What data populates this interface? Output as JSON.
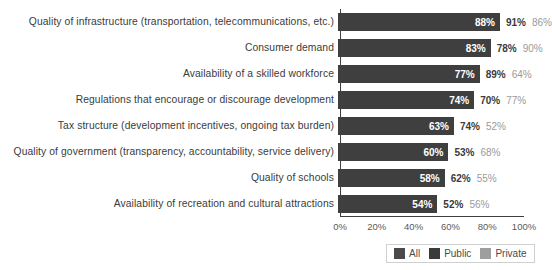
{
  "chart_data": {
    "type": "bar",
    "orientation": "horizontal",
    "title": "",
    "xlabel": "",
    "ylabel": "",
    "xlim": [
      0,
      100
    ],
    "xticks": [
      "0%",
      "20%",
      "40%",
      "60%",
      "80%",
      "100%"
    ],
    "xtick_values": [
      0,
      20,
      40,
      60,
      80,
      100
    ],
    "grid": false,
    "legend_position": "bottom-right",
    "categories": [
      "Quality of infrastructure (transportation, telecommunications, etc.)",
      "Consumer demand",
      "Availability of a skilled workforce",
      "Regulations that encourage or discourage development",
      "Tax structure (development incentives, ongoing tax burden)",
      "Quality of government (transparency, accountability, service delivery)",
      "Quality of schools",
      "Availability of recreation and cultural attractions"
    ],
    "series": [
      {
        "name": "All",
        "color": "#3f3f3f",
        "values": [
          88,
          83,
          77,
          74,
          63,
          60,
          58,
          54
        ],
        "labels": [
          "88%",
          "83%",
          "77%",
          "74%",
          "63%",
          "60%",
          "58%",
          "54%"
        ]
      },
      {
        "name": "Public",
        "color": "#3b3b3b",
        "values": [
          91,
          78,
          89,
          70,
          74,
          53,
          62,
          52
        ],
        "labels": [
          "91%",
          "78%",
          "89%",
          "70%",
          "74%",
          "53%",
          "62%",
          "52%"
        ]
      },
      {
        "name": "Private",
        "color": "#9a9a9a",
        "values": [
          86,
          90,
          64,
          77,
          52,
          68,
          55,
          56
        ],
        "labels": [
          "86%",
          "90%",
          "64%",
          "77%",
          "52%",
          "68%",
          "55%",
          "56%"
        ]
      }
    ]
  },
  "legend": {
    "items": [
      {
        "label": "All",
        "color": "#4a4a4a"
      },
      {
        "label": "Public",
        "color": "#3b3b3b"
      },
      {
        "label": "Private",
        "color": "#9e9e9e"
      }
    ]
  }
}
